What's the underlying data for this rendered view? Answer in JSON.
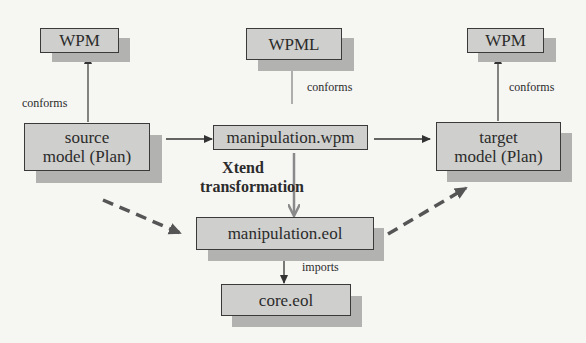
{
  "diagram": {
    "nodes": {
      "wpm_left": {
        "label": "WPM"
      },
      "wpml": {
        "label": "WPML"
      },
      "wpm_right": {
        "label": "WPM"
      },
      "source_model": {
        "line1": "source",
        "line2": "model (Plan)"
      },
      "manipulation_wpm": {
        "label": "manipulation.wpm"
      },
      "target_model": {
        "line1": "target",
        "line2": "model (Plan)"
      },
      "manipulation_eol": {
        "label": "manipulation.eol"
      },
      "core_eol": {
        "label": "core.eol"
      }
    },
    "edges": {
      "conforms_left": "conforms",
      "conforms_middle": "conforms",
      "conforms_right": "conforms",
      "xtend_line1": "Xtend",
      "xtend_line2": "transformation",
      "imports": "imports"
    },
    "colors": {
      "box_fill": "#cfcfcd",
      "box_border": "#3a3a3a",
      "shadow": "#b2b2b0",
      "solid_arrow": "#3a3a3a",
      "xtend_arrow": "#8a8a8a",
      "dashed_arrow": "#555555"
    }
  }
}
